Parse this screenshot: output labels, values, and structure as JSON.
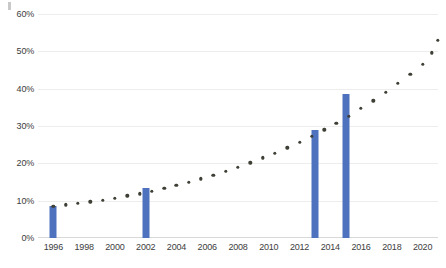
{
  "chart_data": {
    "type": "bar",
    "title": "",
    "subtitle": "",
    "xlabel": "",
    "ylabel": "",
    "xlim": [
      1995,
      2021
    ],
    "ylim": [
      0,
      60
    ],
    "grid": true,
    "legend": "none",
    "y_tick_labels": [
      "0%",
      "10%",
      "20%",
      "30%",
      "40%",
      "50%",
      "60%"
    ],
    "y_tick_values": [
      0,
      10,
      20,
      30,
      40,
      50,
      60
    ],
    "x_tick_labels": [
      "1996",
      "1998",
      "2000",
      "2002",
      "2004",
      "2006",
      "2008",
      "2010",
      "2012",
      "2014",
      "2016",
      "2018",
      "2020"
    ],
    "x_tick_values": [
      1996,
      1998,
      2000,
      2002,
      2004,
      2006,
      2008,
      2010,
      2012,
      2014,
      2016,
      2018,
      2020
    ],
    "series": [
      {
        "name": "bars",
        "type": "bar",
        "color": "#4E72BD",
        "points": [
          {
            "x": 1996,
            "y": 8.5
          },
          {
            "x": 2002,
            "y": 13.5
          },
          {
            "x": 2013,
            "y": 28.8
          },
          {
            "x": 2015,
            "y": 38.5
          }
        ]
      },
      {
        "name": "trend",
        "type": "line",
        "style": "dotted",
        "color": "#3F3F36",
        "points": [
          {
            "x": 1996.0,
            "y": 8.5
          },
          {
            "x": 1996.8,
            "y": 8.9
          },
          {
            "x": 1997.6,
            "y": 9.3
          },
          {
            "x": 1998.4,
            "y": 9.7
          },
          {
            "x": 1999.2,
            "y": 10.2
          },
          {
            "x": 2000.0,
            "y": 10.7
          },
          {
            "x": 2000.8,
            "y": 11.3
          },
          {
            "x": 2001.6,
            "y": 11.9
          },
          {
            "x": 2002.4,
            "y": 12.6
          },
          {
            "x": 2003.2,
            "y": 13.3
          },
          {
            "x": 2004.0,
            "y": 14.1
          },
          {
            "x": 2004.8,
            "y": 15.0
          },
          {
            "x": 2005.6,
            "y": 15.9
          },
          {
            "x": 2006.4,
            "y": 16.9
          },
          {
            "x": 2007.2,
            "y": 17.9
          },
          {
            "x": 2008.0,
            "y": 19.0
          },
          {
            "x": 2008.8,
            "y": 20.2
          },
          {
            "x": 2009.6,
            "y": 21.5
          },
          {
            "x": 2010.4,
            "y": 22.8
          },
          {
            "x": 2011.2,
            "y": 24.2
          },
          {
            "x": 2012.0,
            "y": 25.7
          },
          {
            "x": 2012.8,
            "y": 27.3
          },
          {
            "x": 2013.6,
            "y": 29.0
          },
          {
            "x": 2014.4,
            "y": 30.8
          },
          {
            "x": 2015.2,
            "y": 32.7
          },
          {
            "x": 2016.0,
            "y": 34.7
          },
          {
            "x": 2016.8,
            "y": 36.8
          },
          {
            "x": 2017.6,
            "y": 39.0
          },
          {
            "x": 2018.4,
            "y": 41.4
          },
          {
            "x": 2019.2,
            "y": 43.9
          },
          {
            "x": 2020.0,
            "y": 46.5
          },
          {
            "x": 2020.6,
            "y": 49.6
          },
          {
            "x": 2021.0,
            "y": 53.0
          }
        ]
      }
    ],
    "colors": {
      "bar": "#4E72BD",
      "trend_dot": "#3F3F36",
      "gridline": "#EDEDED",
      "axis": "#D8D8D8",
      "tick_text": "#3D3D3D",
      "background": "#FFFFFF"
    }
  }
}
